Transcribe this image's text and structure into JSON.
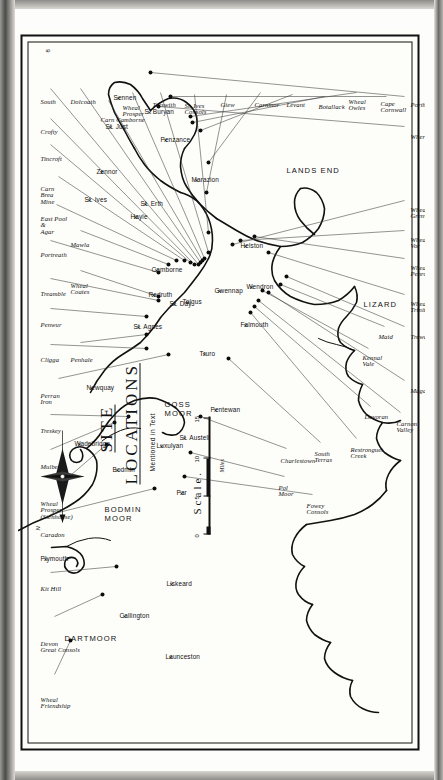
{
  "plate": {
    "title": "SITE",
    "title2": "LOCATIONS",
    "subtitle": "Mentioned in Text",
    "plate_number": "8",
    "scale_word": "Scale.",
    "scale_unit": "Miles",
    "scale_ticks": [
      "0",
      "5",
      "10",
      "15"
    ],
    "compass_label": "N"
  },
  "regions": [
    {
      "name": "DARTMOOR",
      "x": 118,
      "y": 46
    },
    {
      "name": "BODMIN",
      "x": 247,
      "y": 86,
      "name2": "MOOR"
    },
    {
      "name": "GOSS",
      "x": 352,
      "y": 146,
      "name2": "MOOR"
    },
    {
      "name": "LIZARD",
      "x": 452,
      "y": 345
    },
    {
      "name": "LANDS END",
      "x": 586,
      "y": 268
    }
  ],
  "towns": [
    {
      "name": "Plymouth",
      "x": 198,
      "y": 22
    },
    {
      "name": "Callington",
      "x": 141,
      "y": 101
    },
    {
      "name": "Launceston",
      "x": 100,
      "y": 147
    },
    {
      "name": "Liskeard",
      "x": 173,
      "y": 148
    },
    {
      "name": "Bodmin",
      "x": 287,
      "y": 94
    },
    {
      "name": "Wadebridge",
      "x": 313,
      "y": 56
    },
    {
      "name": "Luxulyan",
      "x": 311,
      "y": 138
    },
    {
      "name": "Par",
      "x": 264,
      "y": 158
    },
    {
      "name": "St. Austell",
      "x": 319,
      "y": 161
    },
    {
      "name": "Pentewan",
      "x": 347,
      "y": 192
    },
    {
      "name": "Newquay",
      "x": 369,
      "y": 68
    },
    {
      "name": "St. Agnes",
      "x": 430,
      "y": 115
    },
    {
      "name": "Truro",
      "x": 403,
      "y": 181
    },
    {
      "name": "St. Day",
      "x": 453,
      "y": 151
    },
    {
      "name": "Redruth",
      "x": 462,
      "y": 130
    },
    {
      "name": "Tolgus",
      "x": 455,
      "y": 164
    },
    {
      "name": "Camborne",
      "x": 487,
      "y": 133
    },
    {
      "name": "Falmouth",
      "x": 432,
      "y": 222
    },
    {
      "name": "Gwennap",
      "x": 466,
      "y": 196
    },
    {
      "name": "Wendron",
      "x": 470,
      "y": 228
    },
    {
      "name": "Helston",
      "x": 511,
      "y": 222
    },
    {
      "name": "Hayle",
      "x": 540,
      "y": 112
    },
    {
      "name": "St. Erth",
      "x": 553,
      "y": 122
    },
    {
      "name": "St. Ives",
      "x": 557,
      "y": 66
    },
    {
      "name": "Zennor",
      "x": 585,
      "y": 78
    },
    {
      "name": "Marazion",
      "x": 577,
      "y": 173
    },
    {
      "name": "Penzance",
      "x": 617,
      "y": 142
    },
    {
      "name": "St. Just",
      "x": 630,
      "y": 87
    },
    {
      "name": "S. Buryan",
      "x": 645,
      "y": 126
    },
    {
      "name": "Sennen",
      "x": 659,
      "y": 95
    }
  ],
  "sites": [
    {
      "label": "Wheal",
      "label2": "Friendship",
      "lx": 56,
      "ly": 22,
      "dot": [
        112,
        52
      ]
    },
    {
      "label": "Devon",
      "label2": "Great Consols",
      "lx": 112,
      "ly": 22,
      "dot": [
        158,
        84
      ]
    },
    {
      "label": "Kit Hill",
      "lx": 168,
      "ly": 22,
      "dot": [
        186,
        98
      ]
    },
    {
      "label": "Caradon",
      "lx": 222,
      "ly": 22,
      "dot": [
        264,
        136
      ]
    },
    {
      "label": "Wheal",
      "label2": "Prosper",
      "label3": "(Stenhouse)",
      "lx": 252,
      "ly": 22,
      "dot": [
        308,
        88
      ]
    },
    {
      "label": "Mulberry",
      "lx": 290,
      "ly": 22,
      "dot": [
        330,
        96
      ]
    },
    {
      "label": "Treskey",
      "lx": 326,
      "ly": 22,
      "dot": [
        336,
        110
      ]
    },
    {
      "label": "Perran",
      "label2": "Iron",
      "lx": 360,
      "ly": 22,
      "dot": [
        398,
        150
      ]
    },
    {
      "label": "Cligga",
      "lx": 397,
      "ly": 22,
      "dot": [
        404,
        128
      ]
    },
    {
      "label": "Penhale",
      "lx": 397,
      "ly": 52,
      "dot": [
        418,
        128
      ]
    },
    {
      "label": "Penwur",
      "lx": 432,
      "ly": 22,
      "dot": [
        436,
        128
      ]
    },
    {
      "label": "Treamble",
      "lx": 463,
      "ly": 22,
      "dot": [
        452,
        140
      ]
    },
    {
      "label": "Wheal",
      "label2": "Coates",
      "lx": 470,
      "ly": 52,
      "dot": [
        456,
        140
      ]
    },
    {
      "label": "Portreath",
      "lx": 502,
      "ly": 22,
      "dot": [
        480,
        140
      ]
    },
    {
      "label": "Mawla",
      "lx": 512,
      "ly": 52,
      "dot": [
        488,
        150
      ]
    },
    {
      "label": "East Pool",
      "label2": "&",
      "label3": "Agar",
      "lx": 537,
      "ly": 22,
      "dot": [
        492,
        158
      ]
    },
    {
      "label": "Carn",
      "label2": "Brea",
      "label3": "Mine",
      "lx": 567,
      "ly": 22,
      "dot": [
        492,
        166
      ]
    },
    {
      "label": "Tincroft",
      "lx": 598,
      "ly": 22,
      "dot": [
        490,
        172
      ]
    },
    {
      "label": "Crofty",
      "lx": 625,
      "ly": 22,
      "dot": [
        488,
        176
      ]
    },
    {
      "label": "South",
      "lx": 655,
      "ly": 22,
      "dot": [
        488,
        180
      ]
    },
    {
      "label": "Dolcoath",
      "lx": 655,
      "ly": 52,
      "dot": [
        490,
        182
      ]
    },
    {
      "label": "Carn Camborne",
      "lx": 637,
      "ly": 82,
      "dot": [
        492,
        184
      ]
    },
    {
      "label": "Wheal",
      "label2": "Prosper",
      "lx": 648,
      "ly": 104,
      "dot": [
        494,
        186
      ]
    },
    {
      "label": "Treswith",
      "lx": 652,
      "ly": 134,
      "dot": [
        500,
        190
      ]
    },
    {
      "label": "St. Ives",
      "label2": "Consols",
      "lx": 650,
      "ly": 166,
      "dot": [
        520,
        190
      ]
    },
    {
      "label": "Giew",
      "lx": 652,
      "ly": 202,
      "dot": [
        560,
        188
      ]
    },
    {
      "label": "Carnmor",
      "lx": 652,
      "ly": 236,
      "dot": [
        590,
        190
      ]
    },
    {
      "label": "Levant",
      "lx": 652,
      "ly": 268,
      "dot": [
        622,
        182
      ]
    },
    {
      "label": "Botallack",
      "lx": 650,
      "ly": 300,
      "dot": [
        630,
        174
      ]
    },
    {
      "label": "Wheal",
      "label2": "Owles",
      "lx": 654,
      "ly": 330,
      "dot": [
        636,
        172
      ]
    },
    {
      "label": "Cape",
      "label2": "Cornwall",
      "lx": 652,
      "ly": 362,
      "dot": [
        656,
        152
      ]
    },
    {
      "label": "Porthcurno",
      "lx": 652,
      "ly": 392,
      "dot": [
        680,
        132
      ]
    },
    {
      "label": "Wherry",
      "lx": 620,
      "ly": 392,
      "dot": [
        646,
        140
      ]
    },
    {
      "label": "Wheal",
      "label2": "Grenville",
      "lx": 546,
      "ly": 392,
      "dot": [
        508,
        214
      ]
    },
    {
      "label": "Wheal",
      "label2": "Vor",
      "lx": 516,
      "ly": 392,
      "dot": [
        512,
        222
      ]
    },
    {
      "label": "Wheal",
      "label2": "Penrose",
      "lx": 488,
      "ly": 392,
      "dot": [
        516,
        236
      ]
    },
    {
      "label": "Wheal",
      "label2": "Trinity",
      "lx": 452,
      "ly": 392,
      "dot": [
        500,
        250
      ]
    },
    {
      "label": "Trewavas",
      "lx": 420,
      "ly": 392,
      "dot": [
        476,
        268
      ]
    },
    {
      "label": "Maid",
      "lx": 420,
      "ly": 360,
      "dot": [
        468,
        262
      ]
    },
    {
      "label": "Magdalen",
      "lx": 366,
      "ly": 392,
      "dot": [
        460,
        250
      ]
    },
    {
      "label": "Carnon",
      "label2": "Valley",
      "lx": 332,
      "ly": 378,
      "dot": [
        452,
        240
      ]
    },
    {
      "label": "Devoran",
      "lx": 340,
      "ly": 346,
      "dot": [
        446,
        236
      ]
    },
    {
      "label": "Kennal",
      "label2": "Vale",
      "lx": 398,
      "ly": 344,
      "dot": [
        462,
        244
      ]
    },
    {
      "label": "Restronguet",
      "label2": "Creek",
      "lx": 306,
      "ly": 332,
      "dot": [
        440,
        232
      ]
    },
    {
      "label": "South",
      "label2": "Terras",
      "lx": 302,
      "ly": 296,
      "dot": [
        394,
        210
      ]
    },
    {
      "label": "Charlestown",
      "lx": 296,
      "ly": 262,
      "dot": [
        336,
        182
      ]
    },
    {
      "label": "Pol",
      "label2": "Moor",
      "lx": 268,
      "ly": 260,
      "dot": [
        300,
        172
      ]
    },
    {
      "label": "Fowey",
      "label2": "Consols",
      "lx": 250,
      "ly": 288,
      "dot": [
        276,
        166
      ]
    }
  ],
  "colors": {
    "ink": "#111111",
    "paper": "#fdfdfa",
    "leader": "#3b3b3b"
  }
}
